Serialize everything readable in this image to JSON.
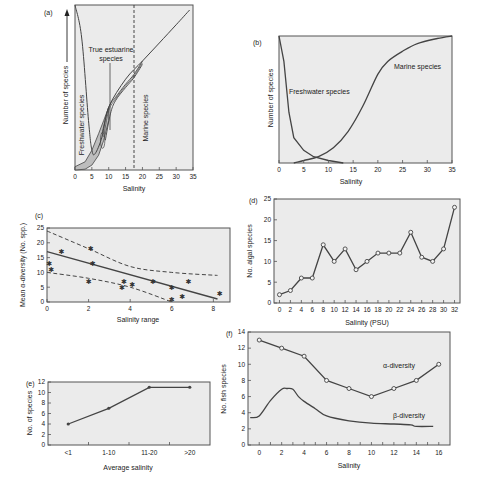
{
  "chart_data": [
    {
      "panel": "(a)",
      "type": "line",
      "title": "",
      "xlabel": "Salinity",
      "ylabel": "Number of species",
      "xticks": [
        "0",
        "5",
        "10",
        "15",
        "20",
        "25",
        "30",
        "35"
      ],
      "xlim": [
        0,
        35
      ],
      "grid": false,
      "annotations": [
        "True estuarine species",
        "Freshwater species",
        "Marine species"
      ],
      "vertical_dashed_line_x": 17.5,
      "series": [
        {
          "name": "Total species (freshwater + estuarine + marine)",
          "x": [
            0,
            2,
            4,
            5,
            6,
            8,
            10,
            15,
            20,
            25,
            30,
            34
          ],
          "y": [
            100,
            80,
            30,
            12,
            10,
            20,
            38,
            55,
            66,
            77,
            88,
            97
          ]
        },
        {
          "name": "True estuarine species band",
          "x": [
            5,
            8,
            10,
            12,
            15,
            17.5,
            20
          ],
          "y": [
            0,
            12,
            30,
            40,
            50,
            58,
            65
          ]
        }
      ]
    },
    {
      "panel": "(b)",
      "type": "line",
      "xlabel": "Salinity",
      "ylabel": "Number of species",
      "xticks": [
        "0",
        "5",
        "10",
        "15",
        "20",
        "25",
        "30",
        "35"
      ],
      "xlim": [
        0,
        35
      ],
      "annotations": [
        "Freshwater species",
        "Marine species"
      ],
      "series": [
        {
          "name": "Freshwater species",
          "x": [
            0,
            1,
            2,
            3,
            5,
            7,
            10,
            13
          ],
          "y": [
            100,
            80,
            40,
            20,
            10,
            5,
            2,
            0
          ]
        },
        {
          "name": "Marine species",
          "x": [
            3,
            5,
            8,
            11,
            14,
            17,
            20,
            22,
            25,
            28,
            32,
            35
          ],
          "y": [
            0,
            2,
            5,
            12,
            25,
            45,
            70,
            80,
            88,
            94,
            98,
            100
          ]
        }
      ]
    },
    {
      "panel": "(c)",
      "type": "scatter",
      "xlabel": "Salinity range",
      "ylabel": "Mean α-diversity (No. spp.)",
      "xticks": [
        "0",
        "2",
        "4",
        "6",
        "8"
      ],
      "yticks": [
        "0",
        "5",
        "10",
        "15",
        "20",
        "25"
      ],
      "xlim": [
        0,
        8.8
      ],
      "ylim": [
        0,
        25
      ],
      "points": {
        "x": [
          0.1,
          0.2,
          0.7,
          2.0,
          2.1,
          2.2,
          3.6,
          3.7,
          4.1,
          5.1,
          6.0,
          6.0,
          6.5,
          6.8,
          8.3
        ],
        "y": [
          13,
          11,
          17,
          7,
          18,
          13,
          5,
          7,
          6,
          7,
          5,
          1,
          2,
          7,
          3
        ]
      },
      "regression": {
        "x": [
          0,
          8.2
        ],
        "y": [
          17,
          1
        ]
      },
      "confidence_upper": {
        "x": [
          0,
          2,
          4,
          6,
          8.2
        ],
        "y": [
          24,
          18,
          12,
          10,
          9
        ]
      },
      "confidence_lower": {
        "x": [
          0,
          2,
          4,
          6
        ],
        "y": [
          10,
          8,
          5,
          0
        ]
      }
    },
    {
      "panel": "(d)",
      "type": "line",
      "xlabel": "Salinity (PSU)",
      "ylabel": "No. algal species",
      "xticks": [
        "0",
        "2",
        "4",
        "6",
        "8",
        "10",
        "12",
        "14",
        "16",
        "18",
        "20",
        "22",
        "24",
        "26",
        "28",
        "30",
        "32"
      ],
      "yticks": [
        "0",
        "5",
        "10",
        "15",
        "20",
        "25"
      ],
      "ylim": [
        0,
        25
      ],
      "x": [
        0,
        2,
        4,
        6,
        8,
        10,
        12,
        14,
        16,
        18,
        20,
        22,
        24,
        26,
        28,
        30,
        32
      ],
      "values": [
        2,
        3,
        6,
        6,
        14,
        10,
        13,
        8,
        10,
        12,
        12,
        12,
        17,
        11,
        10,
        13,
        23
      ]
    },
    {
      "panel": "(e)",
      "type": "line",
      "xlabel": "Average salinity",
      "ylabel": "No. of species",
      "categories": [
        "<1",
        "1-10",
        "11-20",
        ">20"
      ],
      "yticks": [
        "0",
        "2",
        "4",
        "6",
        "8",
        "10",
        "12"
      ],
      "ylim": [
        0,
        12
      ],
      "values": [
        4,
        7,
        11,
        11
      ]
    },
    {
      "panel": "(f)",
      "type": "line",
      "xlabel": "Salinity",
      "ylabel": "No. fish species",
      "xticks": [
        "0",
        "2",
        "4",
        "6",
        "8",
        "10",
        "12",
        "14",
        "16"
      ],
      "yticks": [
        "0",
        "2",
        "4",
        "6",
        "8",
        "10",
        "12",
        "14"
      ],
      "ylim": [
        0,
        14
      ],
      "series": [
        {
          "name": "α-diversity",
          "x": [
            0,
            2,
            4,
            6,
            8,
            10,
            12,
            14,
            16
          ],
          "y": [
            13,
            12,
            11,
            8,
            7,
            6,
            7,
            8,
            10
          ]
        },
        {
          "name": "β-diversity",
          "x": [
            -0.8,
            0,
            1,
            2,
            2.5,
            3,
            3.5,
            4,
            5,
            6,
            8,
            10,
            12,
            13.5,
            14,
            15.5
          ],
          "y": [
            3.4,
            3.6,
            5.5,
            6.9,
            7.0,
            6.9,
            6.0,
            5.4,
            4.5,
            3.6,
            3.0,
            2.7,
            2.6,
            2.5,
            2.3,
            2.3
          ]
        }
      ]
    }
  ],
  "labels": {
    "a": {
      "panel": "(a)",
      "xlabel": "Salinity",
      "ylabel": "Number of species",
      "true_estuarine_1": "True estuarine",
      "true_estuarine_2": "species",
      "freshwater": "Freshwater species",
      "marine": "Marine species",
      "xticks": [
        "0",
        "5",
        "10",
        "15",
        "20",
        "25",
        "30",
        "35"
      ]
    },
    "b": {
      "panel": "(b)",
      "xlabel": "Salinity",
      "ylabel": "Number of species",
      "freshwater": "Freshwater species",
      "marine": "Marine species",
      "xticks": [
        "0",
        "5",
        "10",
        "15",
        "20",
        "25",
        "30",
        "35"
      ]
    },
    "c": {
      "panel": "(c)",
      "xlabel": "Salinity range",
      "ylabel": "Mean α-diversity (No. spp.)",
      "xticks": [
        "0",
        "2",
        "4",
        "6",
        "8"
      ],
      "yticks": [
        "0",
        "5",
        "10",
        "15",
        "20",
        "25"
      ]
    },
    "d": {
      "panel": "(d)",
      "xlabel": "Salinity (PSU)",
      "ylabel": "No. algal species",
      "xticks": [
        "0",
        "2",
        "4",
        "6",
        "8",
        "10",
        "12",
        "14",
        "16",
        "18",
        "20",
        "22",
        "24",
        "26",
        "28",
        "30",
        "32"
      ],
      "yticks": [
        "0",
        "5",
        "10",
        "15",
        "20",
        "25"
      ]
    },
    "e": {
      "panel": "(e)",
      "xlabel": "Average salinity",
      "ylabel": "No. of species",
      "xticks": [
        "<1",
        "1-10",
        "11-20",
        ">20"
      ],
      "yticks": [
        "0",
        "2",
        "4",
        "6",
        "8",
        "10",
        "12"
      ]
    },
    "f": {
      "panel": "(f)",
      "xlabel": "Salinity",
      "ylabel": "No. fish species",
      "alpha": "α-diversity",
      "beta": "β-diversity",
      "xticks": [
        "0",
        "2",
        "4",
        "6",
        "8",
        "10",
        "12",
        "14",
        "16"
      ],
      "yticks": [
        "0",
        "2",
        "4",
        "6",
        "8",
        "10",
        "12",
        "14"
      ]
    }
  },
  "colors": {
    "plot_bg": "#ebebeb",
    "line": "#444444",
    "band": "#bdbdbd",
    "frame": "#555555"
  }
}
